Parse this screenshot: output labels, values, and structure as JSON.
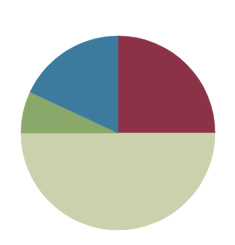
{
  "chart_data": {
    "type": "pie",
    "title": "",
    "subtitle": "",
    "xlabel": "",
    "ylabel": "",
    "grid": false,
    "legend": "none",
    "labels_shown": false,
    "start_angle_deg": 0,
    "direction": "clockwise",
    "center": {
      "x": 118,
      "y": 133
    },
    "radius": 97,
    "background_color": "#ffffff",
    "categories": [
      "Segment 1",
      "Segment 2",
      "Segment 3",
      "Segment 4"
    ],
    "values": [
      25,
      50,
      7,
      18
    ],
    "colors": [
      "#8B3247",
      "#CBD1AC",
      "#8AA86A",
      "#3C7A9E"
    ],
    "slices": [
      {
        "label": "Segment 1",
        "value": 25,
        "percent": "25%",
        "color": "#8B3247",
        "start_angle_deg": 0,
        "end_angle_deg": 90
      },
      {
        "label": "Segment 2",
        "value": 50,
        "percent": "50%",
        "color": "#CBD1AC",
        "start_angle_deg": 90,
        "end_angle_deg": 270
      },
      {
        "label": "Segment 3",
        "value": 7,
        "percent": "7%",
        "color": "#8AA86A",
        "start_angle_deg": 270,
        "end_angle_deg": 295
      },
      {
        "label": "Segment 4",
        "value": 18,
        "percent": "18%",
        "color": "#3C7A9E",
        "start_angle_deg": 295,
        "end_angle_deg": 360
      }
    ]
  }
}
